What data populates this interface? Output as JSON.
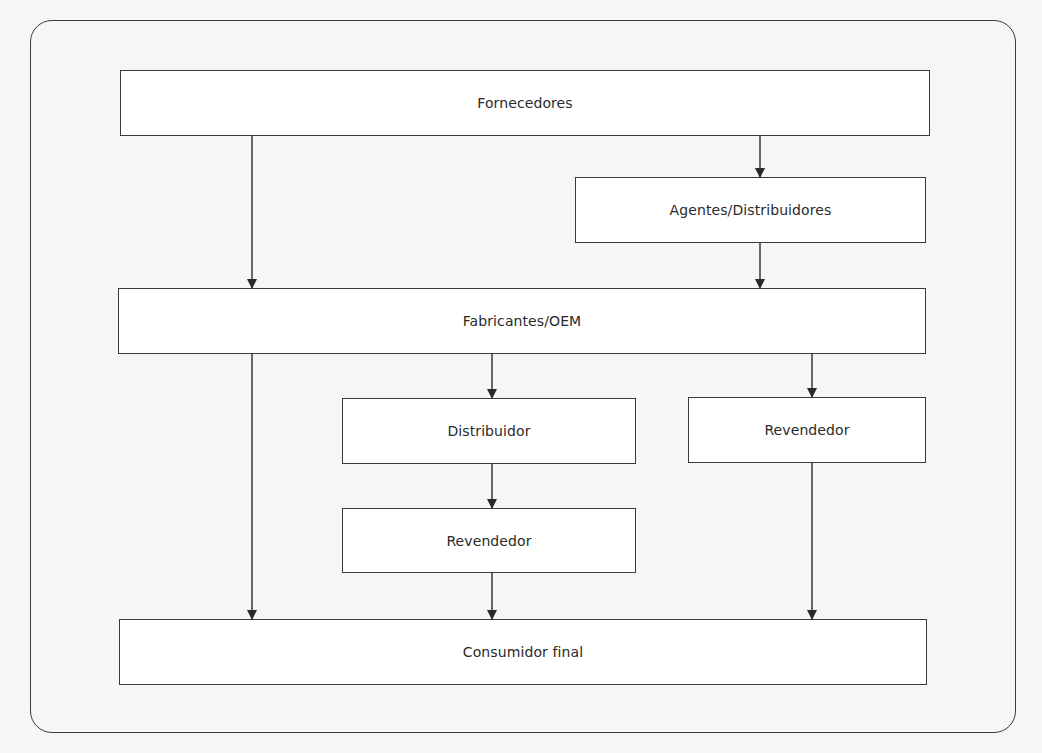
{
  "diagram": {
    "type": "flowchart",
    "title": "",
    "nodes": {
      "fornecedores": {
        "label": "Fornecedores"
      },
      "agentes_distribuidores": {
        "label": "Agentes/Distribuidores"
      },
      "fabricantes_oem": {
        "label": "Fabricantes/OEM"
      },
      "distribuidor": {
        "label": "Distribuidor"
      },
      "revendedor_direto": {
        "label": "Revendedor"
      },
      "revendedor_via_distribuidor": {
        "label": "Revendedor"
      },
      "consumidor_final": {
        "label": "Consumidor final"
      }
    },
    "edges": [
      {
        "from": "fornecedores",
        "to": "fabricantes_oem"
      },
      {
        "from": "fornecedores",
        "to": "agentes_distribuidores"
      },
      {
        "from": "agentes_distribuidores",
        "to": "fabricantes_oem"
      },
      {
        "from": "fabricantes_oem",
        "to": "consumidor_final"
      },
      {
        "from": "fabricantes_oem",
        "to": "distribuidor"
      },
      {
        "from": "fabricantes_oem",
        "to": "revendedor_direto"
      },
      {
        "from": "distribuidor",
        "to": "revendedor_via_distribuidor"
      },
      {
        "from": "revendedor_via_distribuidor",
        "to": "consumidor_final"
      },
      {
        "from": "revendedor_direto",
        "to": "consumidor_final"
      }
    ],
    "colors": {
      "stroke": "#3a3a3a",
      "node_fill": "#ffffff",
      "background": "#f6f6f4"
    }
  }
}
